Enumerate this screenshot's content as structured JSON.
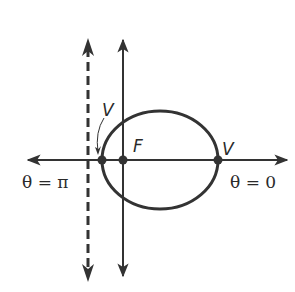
{
  "diagram": {
    "type": "conic-polar-ellipse",
    "labels": {
      "vertex_left": "V",
      "vertex_right": "V",
      "focus": "F",
      "theta_pi": "θ = π",
      "theta_zero": "θ = 0"
    },
    "elements": {
      "polar_axis": {
        "y": 160,
        "x1": 28,
        "x2": 288
      },
      "vertical_axis": {
        "x": 123,
        "y1": 38,
        "y2": 278
      },
      "directrix": {
        "x": 88,
        "y1": 38,
        "y2": 282,
        "style": "dashed"
      },
      "ellipse": {
        "cx": 160,
        "cy": 160,
        "rx": 58,
        "ry": 49
      },
      "points": [
        {
          "name": "V",
          "x": 102,
          "y": 160
        },
        {
          "name": "F",
          "x": 123,
          "y": 160
        },
        {
          "name": "V",
          "x": 218,
          "y": 160
        }
      ]
    },
    "colors": {
      "stroke": "#333333",
      "background": "#ffffff"
    }
  }
}
